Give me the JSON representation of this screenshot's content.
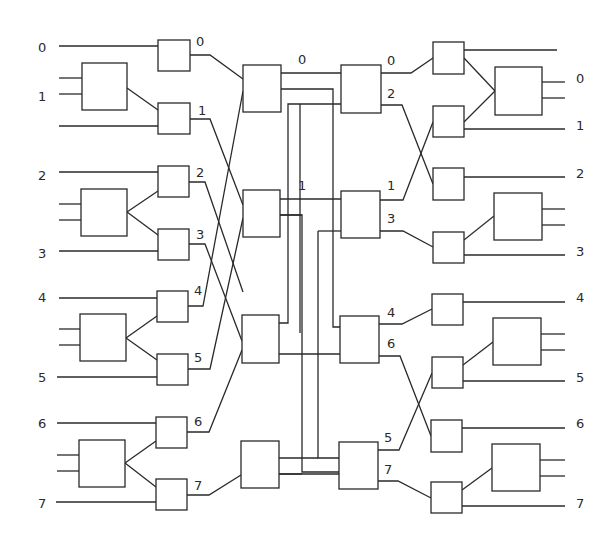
{
  "diagram": {
    "title": "",
    "type": "switching-network",
    "stroke_color": "#2a2a2a",
    "background": "#ffffff",
    "input_labels": [
      {
        "text": "0",
        "x": 38,
        "y": 52
      },
      {
        "text": "1",
        "x": 38,
        "y": 101
      },
      {
        "text": "2",
        "x": 38,
        "y": 180
      },
      {
        "text": "3",
        "x": 38,
        "y": 258
      },
      {
        "text": "4",
        "x": 38,
        "y": 302
      },
      {
        "text": "5",
        "x": 38,
        "y": 382
      },
      {
        "text": "6",
        "x": 38,
        "y": 428
      },
      {
        "text": "7",
        "x": 38,
        "y": 508
      }
    ],
    "output_labels": [
      {
        "text": "0",
        "x": 576,
        "y": 83
      },
      {
        "text": "1",
        "x": 576,
        "y": 130
      },
      {
        "text": "2",
        "x": 576,
        "y": 178
      },
      {
        "text": "3",
        "x": 576,
        "y": 256
      },
      {
        "text": "4",
        "x": 576,
        "y": 302
      },
      {
        "text": "5",
        "x": 576,
        "y": 382
      },
      {
        "text": "6",
        "x": 576,
        "y": 428
      },
      {
        "text": "7",
        "x": 576,
        "y": 508
      }
    ],
    "stage1_port_labels": [
      {
        "text": "0",
        "x": 196,
        "y": 46
      },
      {
        "text": "1",
        "x": 198,
        "y": 115
      },
      {
        "text": "2",
        "x": 196,
        "y": 177
      },
      {
        "text": "3",
        "x": 196,
        "y": 239
      },
      {
        "text": "4",
        "x": 194,
        "y": 295
      },
      {
        "text": "5",
        "x": 194,
        "y": 362
      },
      {
        "text": "6",
        "x": 194,
        "y": 426
      },
      {
        "text": "7",
        "x": 194,
        "y": 490
      }
    ],
    "stage2_port_labels": [
      {
        "text": "0",
        "x": 298,
        "y": 64
      },
      {
        "text": "1",
        "x": 298,
        "y": 190
      }
    ],
    "stage3_port_labels": [
      {
        "text": "0",
        "x": 387,
        "y": 65
      },
      {
        "text": "2",
        "x": 387,
        "y": 98
      },
      {
        "text": "1",
        "x": 387,
        "y": 190
      },
      {
        "text": "3",
        "x": 387,
        "y": 223
      },
      {
        "text": "4",
        "x": 387,
        "y": 317
      },
      {
        "text": "6",
        "x": 387,
        "y": 348
      },
      {
        "text": "5",
        "x": 384,
        "y": 442
      },
      {
        "text": "7",
        "x": 384,
        "y": 474
      }
    ],
    "boxes": [
      {
        "name": "input-switch-0",
        "x": 158,
        "y": 40,
        "w": 32,
        "h": 31
      },
      {
        "name": "input-switch-1",
        "x": 158,
        "y": 103,
        "w": 32,
        "h": 31
      },
      {
        "name": "input-switch-2",
        "x": 158,
        "y": 166,
        "w": 31,
        "h": 31
      },
      {
        "name": "input-switch-3",
        "x": 158,
        "y": 229,
        "w": 31,
        "h": 31
      },
      {
        "name": "input-switch-4",
        "x": 157,
        "y": 291,
        "w": 31,
        "h": 31
      },
      {
        "name": "input-switch-5",
        "x": 157,
        "y": 354,
        "w": 31,
        "h": 31
      },
      {
        "name": "input-switch-6",
        "x": 156,
        "y": 417,
        "w": 31,
        "h": 31
      },
      {
        "name": "input-switch-7",
        "x": 156,
        "y": 479,
        "w": 31,
        "h": 31
      },
      {
        "name": "input-module-a",
        "x": 82,
        "y": 63,
        "w": 45,
        "h": 47
      },
      {
        "name": "input-module-b",
        "x": 81,
        "y": 189,
        "w": 46,
        "h": 47
      },
      {
        "name": "input-module-c",
        "x": 80,
        "y": 314,
        "w": 46,
        "h": 47
      },
      {
        "name": "input-module-d",
        "x": 79,
        "y": 440,
        "w": 46,
        "h": 47
      },
      {
        "name": "stage2-switch-0",
        "x": 243,
        "y": 65,
        "w": 38,
        "h": 47
      },
      {
        "name": "stage2-switch-1",
        "x": 243,
        "y": 190,
        "w": 37,
        "h": 47
      },
      {
        "name": "stage2-switch-2",
        "x": 242,
        "y": 315,
        "w": 37,
        "h": 48
      },
      {
        "name": "stage2-switch-3",
        "x": 241,
        "y": 441,
        "w": 38,
        "h": 47
      },
      {
        "name": "stage3-switch-0",
        "x": 341,
        "y": 65,
        "w": 40,
        "h": 48
      },
      {
        "name": "stage3-switch-1",
        "x": 341,
        "y": 191,
        "w": 39,
        "h": 47
      },
      {
        "name": "stage3-switch-2",
        "x": 340,
        "y": 316,
        "w": 39,
        "h": 47
      },
      {
        "name": "stage3-switch-3",
        "x": 339,
        "y": 442,
        "w": 39,
        "h": 47
      },
      {
        "name": "output-switch-0",
        "x": 433,
        "y": 42,
        "w": 31,
        "h": 32
      },
      {
        "name": "output-switch-1",
        "x": 433,
        "y": 106,
        "w": 31,
        "h": 31
      },
      {
        "name": "output-switch-2",
        "x": 433,
        "y": 168,
        "w": 31,
        "h": 32
      },
      {
        "name": "output-switch-3",
        "x": 433,
        "y": 232,
        "w": 31,
        "h": 31
      },
      {
        "name": "output-switch-4",
        "x": 432,
        "y": 294,
        "w": 31,
        "h": 31
      },
      {
        "name": "output-switch-5",
        "x": 432,
        "y": 357,
        "w": 31,
        "h": 31
      },
      {
        "name": "output-switch-6",
        "x": 431,
        "y": 420,
        "w": 31,
        "h": 32
      },
      {
        "name": "output-switch-7",
        "x": 431,
        "y": 482,
        "w": 31,
        "h": 31
      },
      {
        "name": "output-module-a",
        "x": 495,
        "y": 67,
        "w": 47,
        "h": 48
      },
      {
        "name": "output-module-b",
        "x": 494,
        "y": 193,
        "w": 48,
        "h": 47
      },
      {
        "name": "output-module-c",
        "x": 493,
        "y": 318,
        "w": 48,
        "h": 47
      },
      {
        "name": "output-module-d",
        "x": 492,
        "y": 444,
        "w": 48,
        "h": 47
      }
    ],
    "wires": [
      [
        59,
        46,
        158,
        46
      ],
      [
        59,
        78,
        82,
        78
      ],
      [
        59,
        94,
        82,
        94
      ],
      [
        127,
        88,
        158,
        110
      ],
      [
        59,
        126,
        158,
        126
      ],
      [
        190,
        55,
        210,
        55,
        243,
        79
      ],
      [
        190,
        119,
        210,
        119,
        243,
        205
      ],
      [
        59,
        172,
        158,
        172
      ],
      [
        59,
        204,
        81,
        204
      ],
      [
        59,
        220,
        81,
        220
      ],
      [
        127,
        212,
        158,
        191
      ],
      [
        127,
        212,
        158,
        235
      ],
      [
        59,
        251,
        158,
        251
      ],
      [
        189,
        182,
        205,
        182,
        243,
        292
      ],
      [
        189,
        244,
        205,
        244,
        242,
        341
      ],
      [
        59,
        298,
        158,
        298
      ],
      [
        59,
        329,
        80,
        329
      ],
      [
        59,
        345,
        80,
        345
      ],
      [
        126,
        338,
        157,
        316
      ],
      [
        126,
        338,
        157,
        360
      ],
      [
        57,
        377,
        157,
        377
      ],
      [
        188,
        306,
        203,
        306,
        243,
        91
      ],
      [
        188,
        369,
        210,
        369,
        243,
        218
      ],
      [
        57,
        423,
        156,
        423
      ],
      [
        57,
        455,
        79,
        455
      ],
      [
        57,
        471,
        79,
        471
      ],
      [
        125,
        463,
        156,
        441
      ],
      [
        125,
        463,
        156,
        487
      ],
      [
        56,
        502,
        156,
        502
      ],
      [
        187,
        432,
        209,
        432,
        242,
        350
      ],
      [
        187,
        495,
        209,
        495,
        241,
        475
      ],
      [
        281,
        73,
        341,
        73
      ],
      [
        281,
        89,
        333,
        89,
        333,
        327,
        340,
        327
      ],
      [
        300,
        104,
        341,
        104
      ],
      [
        300,
        104,
        300,
        333,
        300,
        333
      ],
      [
        280,
        199,
        341,
        199
      ],
      [
        280,
        215,
        302,
        215,
        302,
        472,
        339,
        472
      ],
      [
        280,
        215,
        302,
        215
      ],
      [
        318,
        231,
        341,
        231
      ],
      [
        318,
        231,
        318,
        458,
        339,
        458
      ],
      [
        279,
        354,
        340,
        354
      ],
      [
        279,
        323,
        288,
        323,
        288,
        104,
        300,
        104
      ],
      [
        279,
        458,
        318,
        458
      ],
      [
        279,
        474,
        302,
        474
      ],
      [
        279,
        474,
        339,
        474
      ],
      [
        381,
        73,
        411,
        73,
        433,
        58
      ],
      [
        381,
        105,
        402,
        105,
        433,
        184
      ],
      [
        380,
        200,
        403,
        200,
        433,
        122
      ],
      [
        380,
        231,
        403,
        231,
        433,
        247
      ],
      [
        379,
        324,
        402,
        324,
        432,
        309
      ],
      [
        379,
        356,
        400,
        356,
        431,
        436
      ],
      [
        378,
        450,
        399,
        450,
        432,
        373
      ],
      [
        378,
        481,
        398,
        481,
        431,
        498
      ],
      [
        464,
        50,
        557,
        50
      ],
      [
        464,
        58,
        495,
        91
      ],
      [
        464,
        122,
        495,
        91
      ],
      [
        464,
        129,
        565,
        129
      ],
      [
        464,
        177,
        565,
        177
      ],
      [
        542,
        82,
        565,
        82
      ],
      [
        542,
        98,
        565,
        98
      ],
      [
        464,
        240,
        494,
        216
      ],
      [
        542,
        209,
        565,
        209
      ],
      [
        542,
        225,
        565,
        225
      ],
      [
        464,
        255,
        565,
        255
      ],
      [
        463,
        302,
        565,
        302
      ],
      [
        463,
        365,
        493,
        342
      ],
      [
        541,
        334,
        565,
        334
      ],
      [
        541,
        350,
        565,
        350
      ],
      [
        463,
        381,
        565,
        381
      ],
      [
        462,
        428,
        565,
        428
      ],
      [
        462,
        490,
        492,
        468
      ],
      [
        540,
        460,
        565,
        460
      ],
      [
        540,
        476,
        565,
        476
      ],
      [
        462,
        506,
        565,
        506
      ]
    ]
  }
}
